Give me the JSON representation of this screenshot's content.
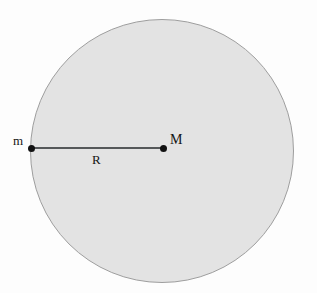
{
  "figure": {
    "background_color": "#fdfdfd",
    "clipped_header_text": "",
    "sphere": {
      "name": "large-body",
      "fill_color": "#e3e3e3",
      "border_color": "#9e9e9e",
      "center_x": 162,
      "center_y": 151,
      "radius_px": 132
    },
    "radius_segment": {
      "label": "R",
      "color": "#55585a",
      "from_x": 31,
      "to_x": 163,
      "y": 148
    },
    "points": [
      {
        "id": "surface-mass",
        "label": "m",
        "x": 31,
        "y": 148,
        "color": "#111111"
      },
      {
        "id": "center-mass",
        "label": "M",
        "x": 163,
        "y": 148,
        "color": "#111111"
      }
    ]
  }
}
